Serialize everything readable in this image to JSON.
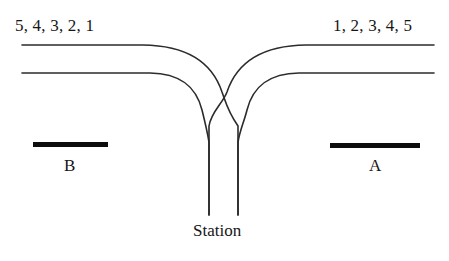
{
  "figure": {
    "background_color": "#ffffff",
    "line_color": "#2b2b2b",
    "bar_color": "#0d0d0d"
  },
  "labels": {
    "left_carriages": "5, 4, 3, 2, 1",
    "right_carriages": "1, 2, 3, 4, 5",
    "platform_b": "B",
    "platform_a": "A",
    "station": "Station"
  },
  "diagram_data": {
    "type": "schematic",
    "description": "Two horizontal running lines at the top that curve downward in the centre, cross over each other, and continue as two vertical tracks descending to the station. Two solid platform bars labelled B (left) and A (right) sit below the horizontal lines.",
    "elements": [
      {
        "name": "upper-running-line",
        "kind": "track",
        "path": "Horizontal from x=22 to x=145 at y=45, curving down and right to cross near x=227,y=105, then vertical at x=238 down to y=215",
        "stroke_width": 1.6
      },
      {
        "name": "lower-running-line",
        "kind": "track",
        "path": "Horizontal from x=22 to x=152 at y=73, curving down and right to vertical at x=209 down to y=215",
        "stroke_width": 1.6
      },
      {
        "name": "upper-running-line-right",
        "kind": "track",
        "path": "Horizontal from x=434 to x=304 at y=45, curving down and left to cross near x=227,y=105, then vertical at x=209 down to y=215",
        "stroke_width": 1.6
      },
      {
        "name": "lower-running-line-right",
        "kind": "track",
        "path": "Horizontal from x=434 to x=297 at y=73, curving down and left to vertical at x=238 down to y=215",
        "stroke_width": 1.6
      },
      {
        "name": "platform-bar-b",
        "kind": "platform",
        "x": 33,
        "y": 142,
        "width": 75,
        "height": 5,
        "label": "B"
      },
      {
        "name": "platform-bar-a",
        "kind": "platform",
        "x": 330,
        "y": 143,
        "width": 90,
        "height": 5,
        "label": "A"
      }
    ],
    "crossing_point": {
      "x": 227,
      "y": 105
    },
    "vertical_track_x": [
      209,
      238
    ],
    "vertical_track_bottom_y": 215,
    "horizontal_track_y": [
      45,
      73
    ]
  }
}
